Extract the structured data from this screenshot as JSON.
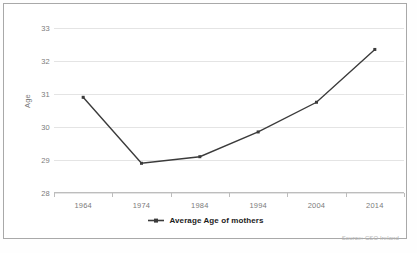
{
  "chart_data": {
    "type": "line",
    "title": "",
    "xlabel": "",
    "ylabel": "Age",
    "categories": [
      "1964",
      "1974",
      "1984",
      "1994",
      "2004",
      "2014"
    ],
    "series": [
      {
        "name": "Average Age of mothers",
        "values": [
          30.9,
          28.9,
          29.1,
          29.85,
          30.75,
          32.35
        ]
      }
    ],
    "ylim": [
      28,
      33
    ],
    "yticks": [
      "28",
      "29",
      "30",
      "31",
      "32",
      "33"
    ],
    "grid": true,
    "legend_position": "bottom-center",
    "line_color": "#3b3b3b",
    "grid_color": "#e4e4e4",
    "axis_color": "#bdbdbd",
    "tick_label_color": "#7b7b7b"
  },
  "legend": {
    "label": "Average Age of mothers",
    "marker": "line-with-square-marker"
  },
  "annotations": {
    "source": "Source: CSO Ireland",
    "bottom_caption": ""
  }
}
